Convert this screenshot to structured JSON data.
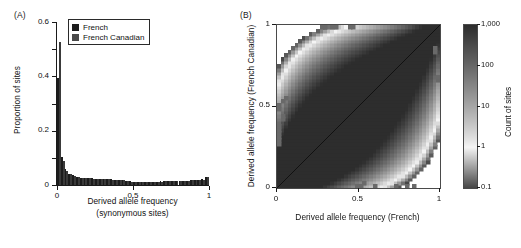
{
  "figure": {
    "panels": [
      {
        "tag": "(A)"
      },
      {
        "tag": "(B)"
      }
    ]
  },
  "panelA": {
    "tag": "(A)",
    "ylabel": "Proportion of sites",
    "xlabel_line1": "Derived allele frequency",
    "xlabel_line2": "(synonymous sites)",
    "yticks": [
      "0",
      "0.2",
      "0.4",
      "0.6"
    ],
    "xticks": [
      "0",
      "0.5",
      "1"
    ],
    "legend": {
      "items": [
        {
          "label": "French",
          "color": "#1c1c1c"
        },
        {
          "label": "French Canadian",
          "color": "#4a4a4a"
        }
      ]
    }
  },
  "panelB": {
    "tag": "(B)",
    "xlabel": "Derived allele frequency (French)",
    "ylabel": "Derived allele frequency (French Canadian)",
    "xticks": [
      "0",
      "0.5",
      "1"
    ],
    "yticks": [
      "0",
      "0.5",
      "1"
    ],
    "colorbar": {
      "title": "Count of sites",
      "ticks": [
        "1,000",
        "100",
        "10",
        "1",
        "0.1"
      ]
    }
  },
  "chart_data": [
    {
      "type": "bar",
      "title": "",
      "xlabel": "Derived allele frequency (synonymous sites)",
      "ylabel": "Proportion of sites",
      "xlim": [
        0,
        1
      ],
      "ylim": [
        0,
        0.6
      ],
      "grid": false,
      "legend_position": "top-center",
      "categories": [
        "0.000-0.025",
        "0.025-0.050",
        "0.050-0.075",
        "0.075-0.100",
        "0.100-0.125",
        "0.125-0.150",
        "0.150-0.175",
        "0.175-0.200",
        "0.200-0.225",
        "0.225-0.250",
        "0.250-0.275",
        "0.275-0.300",
        "0.300-0.325",
        "0.325-0.350",
        "0.350-0.375",
        "0.375-0.400",
        "0.400-0.425",
        "0.425-0.450",
        "0.450-0.475",
        "0.475-0.500",
        "0.500-0.525",
        "0.525-0.550",
        "0.550-0.575",
        "0.575-0.600",
        "0.600-0.625",
        "0.625-0.650",
        "0.650-0.675",
        "0.675-0.700",
        "0.700-0.725",
        "0.725-0.750",
        "0.750-0.775",
        "0.775-0.800",
        "0.800-0.825",
        "0.825-0.850",
        "0.850-0.875",
        "0.875-0.900",
        "0.900-0.925",
        "0.925-0.950",
        "0.950-0.975",
        "0.975-1.000"
      ],
      "series": [
        {
          "name": "French",
          "color": "#1c1c1c",
          "values": [
            0.395,
            0.103,
            0.06,
            0.042,
            0.036,
            0.03,
            0.027,
            0.026,
            0.025,
            0.024,
            0.023,
            0.023,
            0.022,
            0.021,
            0.021,
            0.02,
            0.019,
            0.018,
            0.015,
            0.013,
            0.01,
            0.01,
            0.01,
            0.011,
            0.011,
            0.012,
            0.012,
            0.013,
            0.013,
            0.014,
            0.014,
            0.015,
            0.015,
            0.016,
            0.016,
            0.017,
            0.018,
            0.019,
            0.021,
            0.029
          ]
        },
        {
          "name": "French Canadian",
          "color": "#3a3a3a",
          "values": [
            0.525,
            0.087,
            0.053,
            0.039,
            0.033,
            0.029,
            0.026,
            0.025,
            0.024,
            0.023,
            0.023,
            0.022,
            0.021,
            0.021,
            0.02,
            0.019,
            0.018,
            0.017,
            0.014,
            0.012,
            0.01,
            0.01,
            0.01,
            0.01,
            0.011,
            0.011,
            0.012,
            0.012,
            0.013,
            0.013,
            0.014,
            0.014,
            0.015,
            0.015,
            0.016,
            0.017,
            0.017,
            0.018,
            0.02,
            0.028
          ]
        }
      ]
    },
    {
      "type": "heatmap",
      "title": "",
      "xlabel": "Derived allele frequency (French)",
      "ylabel": "Derived allele frequency (French Canadian)",
      "xlim": [
        0,
        1
      ],
      "ylim": [
        0,
        1
      ],
      "grid": false,
      "colorbar_label": "Count of sites",
      "colorbar_scale": "log",
      "colorbar_ticks": [
        1000,
        100,
        10,
        1,
        0.1
      ],
      "nbins": 46,
      "description": "Joint density of derived allele frequency in French (x) versus French Canadian (y); sites concentrate along the diagonal with a broad band widening toward intermediate frequencies."
    }
  ]
}
